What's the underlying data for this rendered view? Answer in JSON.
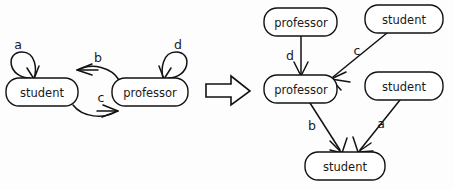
{
  "figure": {
    "kind": "graph-transformation-diagram",
    "ink_color": "#121212",
    "paper_color": "#ffffff"
  },
  "transform_arrow": {
    "icon": "block-right-arrow-icon",
    "direction": "right"
  },
  "left_graph": {
    "title": "",
    "nodes": [
      {
        "id": "L-student",
        "label": "student",
        "cx": 42,
        "cy": 92,
        "w": 72,
        "h": 28
      },
      {
        "id": "L-professor",
        "label": "professor",
        "cx": 150,
        "cy": 92,
        "w": 76,
        "h": 28
      }
    ],
    "edges": [
      {
        "id": "L-a",
        "label": "a",
        "from": "L-student",
        "to": "L-student",
        "kind": "self-loop",
        "label_x": 18,
        "label_y": 45
      },
      {
        "id": "L-b",
        "label": "b",
        "from": "L-professor",
        "to": "L-student",
        "kind": "arc-upper",
        "label_x": 98,
        "label_y": 58
      },
      {
        "id": "L-c",
        "label": "c",
        "from": "L-student",
        "to": "L-professor",
        "kind": "arc-lower",
        "label_x": 101,
        "label_y": 98
      },
      {
        "id": "L-d",
        "label": "d",
        "from": "L-professor",
        "to": "L-professor",
        "kind": "self-loop",
        "label_x": 178,
        "label_y": 45
      }
    ]
  },
  "right_graph": {
    "title": "",
    "nodes": [
      {
        "id": "R-professor-top",
        "label": "professor",
        "cx": 301,
        "cy": 22,
        "w": 73,
        "h": 28
      },
      {
        "id": "R-student-top",
        "label": "student",
        "cx": 404,
        "cy": 19,
        "w": 78,
        "h": 28
      },
      {
        "id": "R-professor-mid",
        "label": "professor",
        "cx": 301,
        "cy": 89,
        "w": 73,
        "h": 28
      },
      {
        "id": "R-student-mid",
        "label": "student",
        "cx": 404,
        "cy": 86,
        "w": 78,
        "h": 28
      },
      {
        "id": "R-student-bottom",
        "label": "student",
        "cx": 345,
        "cy": 166,
        "w": 80,
        "h": 28
      }
    ],
    "edges": [
      {
        "id": "R-d",
        "label": "d",
        "from": "R-professor-top",
        "to": "R-professor-mid",
        "kind": "straight",
        "label_x": 290,
        "label_y": 56
      },
      {
        "id": "R-c",
        "label": "c",
        "from": "R-student-top",
        "to": "R-professor-mid",
        "kind": "straight",
        "label_x": 356,
        "label_y": 51
      },
      {
        "id": "R-b",
        "label": "b",
        "from": "R-professor-mid",
        "to": "R-student-bottom",
        "kind": "straight",
        "label_x": 312,
        "label_y": 126
      },
      {
        "id": "R-a",
        "label": "a",
        "from": "R-student-mid",
        "to": "R-student-bottom",
        "kind": "straight",
        "label_x": 381,
        "label_y": 124
      }
    ]
  }
}
